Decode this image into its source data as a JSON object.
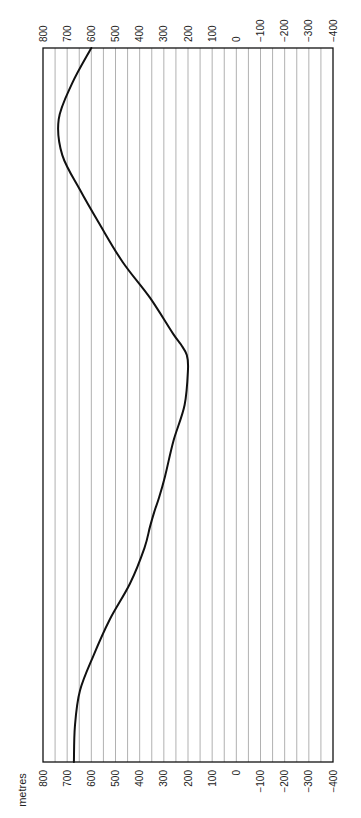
{
  "chart_data": {
    "type": "line",
    "title": "",
    "orientation": "rotated-90",
    "xlabel": "",
    "ylabel": "metres",
    "ylim": [
      -400,
      800
    ],
    "ticks": [
      800,
      700,
      600,
      500,
      400,
      300,
      200,
      100,
      0,
      -100,
      -200,
      -300,
      -400
    ],
    "tick_labels": [
      "800",
      "700",
      "600",
      "500",
      "400",
      "300",
      "200",
      "100",
      "0",
      "−100",
      "−200",
      "−300",
      "−400"
    ],
    "gridline_step": 50,
    "grid": true,
    "legend": null,
    "series": [
      {
        "name": "profile",
        "color": "#111111",
        "x": [
          0,
          5,
          10,
          15,
          20,
          25,
          30,
          33,
          35,
          37,
          40,
          45,
          50,
          55,
          57,
          58.5,
          60,
          65,
          70,
          75,
          80,
          85,
          90,
          95,
          100
        ],
        "values": [
          672,
          668,
          647,
          590,
          523,
          440,
          380,
          357,
          340,
          320,
          295,
          260,
          214,
          200,
          205,
          230,
          262,
          357,
          470,
          560,
          645,
          720,
          735,
          680,
          600
        ]
      }
    ],
    "x_scale": "normalized 0-100 along the profile (bottom-to-top of image)"
  },
  "labels": {
    "unit": "metres"
  }
}
